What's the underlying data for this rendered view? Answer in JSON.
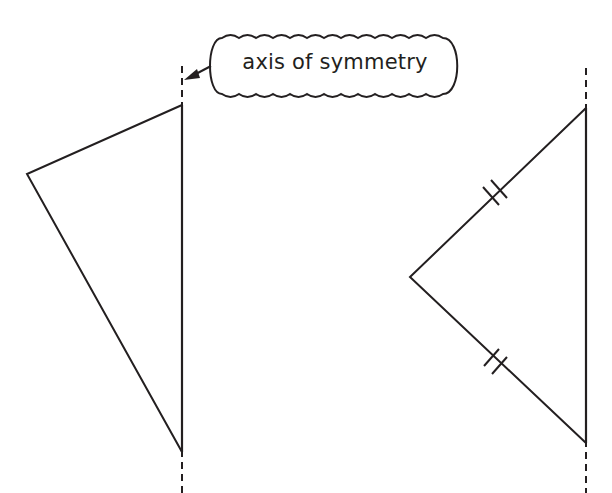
{
  "diagram": {
    "stroke_color": "#231f20",
    "background": "#ffffff",
    "callout": {
      "label": "axis of symmetry",
      "points_to": "left-axis"
    },
    "axes": [
      {
        "id": "left-axis",
        "x": 182,
        "y1": 66,
        "y2": 493,
        "style": "dashed"
      },
      {
        "id": "right-axis",
        "x": 586,
        "y1": 68,
        "y2": 493,
        "style": "dashed"
      }
    ],
    "shapes": [
      {
        "id": "left-triangle",
        "vertices": [
          [
            182,
            105
          ],
          [
            27,
            174
          ],
          [
            182,
            452
          ]
        ]
      },
      {
        "id": "right-triangle",
        "vertices": [
          [
            586,
            108
          ],
          [
            410,
            277
          ],
          [
            586,
            443
          ]
        ],
        "equal_side_marks": [
          "upper-left-side",
          "lower-left-side"
        ]
      }
    ]
  }
}
